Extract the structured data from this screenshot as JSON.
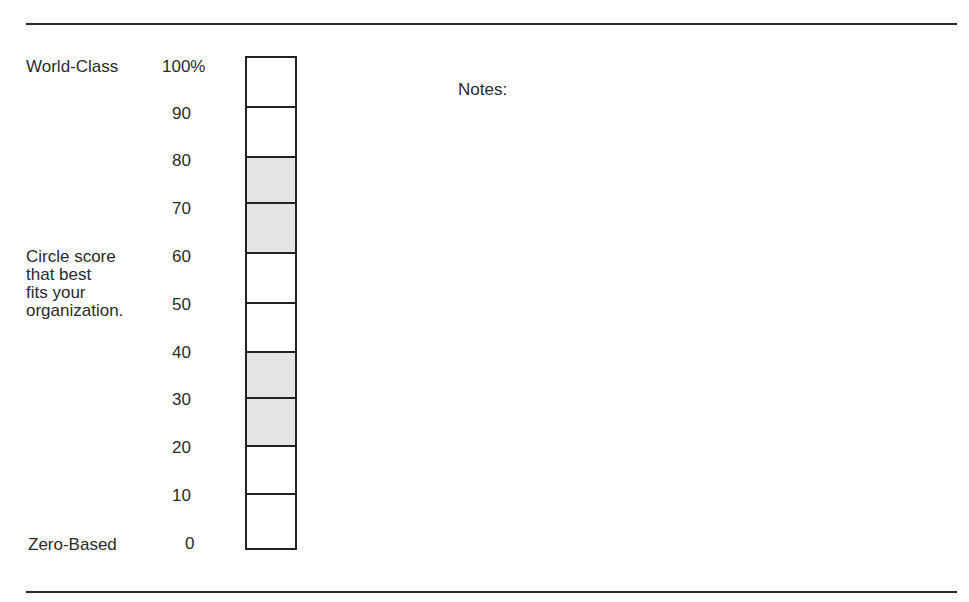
{
  "form": {
    "top_label": "World-Class",
    "bottom_label": "Zero-Based",
    "instruction_lines": [
      "Circle score",
      "that best",
      "fits your",
      "organization."
    ],
    "notes_label": "Notes:"
  },
  "scale": {
    "ticks": [
      "100%",
      "90",
      "80",
      "70",
      "60",
      "50",
      "40",
      "30",
      "20",
      "10",
      "0"
    ],
    "cells": [
      {
        "range": "90-100",
        "shaded": false
      },
      {
        "range": "80-90",
        "shaded": false
      },
      {
        "range": "70-80",
        "shaded": true
      },
      {
        "range": "60-70",
        "shaded": true
      },
      {
        "range": "50-60",
        "shaded": false
      },
      {
        "range": "40-50",
        "shaded": false
      },
      {
        "range": "30-40",
        "shaded": true
      },
      {
        "range": "20-30",
        "shaded": true
      },
      {
        "range": "10-20",
        "shaded": false
      },
      {
        "range": "0-10",
        "shaded": false
      }
    ],
    "shade_color": "#e4e4e4",
    "border_color": "#222222"
  }
}
